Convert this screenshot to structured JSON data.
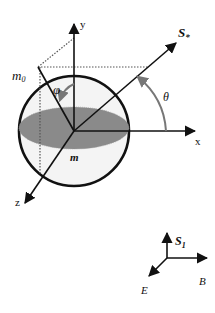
{
  "diagram": {
    "type": "spin-sphere-coordinate-diagram",
    "colors": {
      "line": "#111111",
      "disk_fill": "#8a8a8a",
      "sphere_fill": "#f4f4f4",
      "angle_arc": "#777777",
      "dotted": "#555555"
    },
    "sphere": {
      "labels": {
        "m0": "m",
        "m0_sub": "0",
        "m": "m"
      }
    },
    "axes": {
      "x": "x",
      "y": "y",
      "z": "z"
    },
    "vector": {
      "label": "S",
      "sub": "*"
    },
    "angles": {
      "phi": "φ",
      "theta": "θ"
    },
    "triad": {
      "up_label": "S",
      "up_sub": "1",
      "right_label": "B",
      "diag_label": "E"
    }
  }
}
